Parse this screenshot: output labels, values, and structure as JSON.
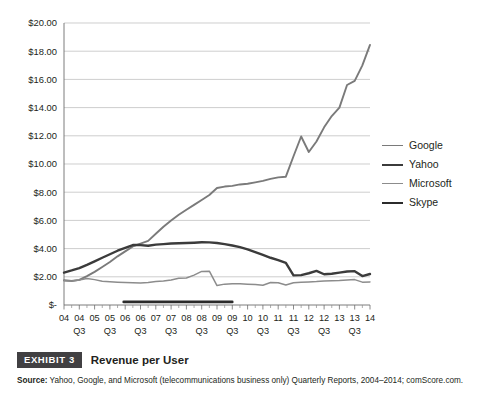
{
  "caption": {
    "badge": "EXHIBIT 3",
    "title": "Revenue per User",
    "source_label": "Source:",
    "source_text": " Yahoo, Google, and Microsoft (telecommunications business only) Quarterly Reports, 2004–2014; comScore.com."
  },
  "legend": {
    "position": "right",
    "items": [
      {
        "label": "Google",
        "color": "#7a7a7a",
        "width": 1.9
      },
      {
        "label": "Yahoo",
        "color": "#3b3b3b",
        "width": 2.4
      },
      {
        "label": "Microsoft",
        "color": "#8c8c8c",
        "width": 1.5
      },
      {
        "label": "Skype",
        "color": "#2b2b2b",
        "width": 2.6
      }
    ]
  },
  "chart_data": {
    "type": "line",
    "title": "Revenue per User",
    "xlabel": "",
    "ylabel": "",
    "ylim": [
      0,
      20
    ],
    "ytick_values": [
      0,
      2,
      4,
      6,
      8,
      10,
      12,
      14,
      16,
      18,
      20
    ],
    "ytick_labels": [
      "$-",
      "$2.00",
      "$4.00",
      "$6.00",
      "$8.00",
      "$10.00",
      "$12.00",
      "$14.00",
      "$16.00",
      "$18.00",
      "$20.00"
    ],
    "grid": true,
    "grid_axis": "y",
    "x_tick_top_labels": [
      "04",
      "04",
      "05",
      "05",
      "06",
      "06",
      "07",
      "07",
      "08",
      "08",
      "09",
      "09",
      "10",
      "10",
      "11",
      "11",
      "12",
      "12",
      "13",
      "13",
      "14"
    ],
    "x_tick_bottom_labels": [
      "",
      "Q3",
      "",
      "Q3",
      "",
      "Q3",
      "",
      "Q3",
      "",
      "Q3",
      "",
      "Q3",
      "",
      "Q3",
      "",
      "Q3",
      "",
      "Q3",
      "",
      "Q3",
      ""
    ],
    "x_minor_ticks_per_label": 2,
    "categories": [
      "04 Q1",
      "04 Q3",
      "05 Q1",
      "05 Q3",
      "06 Q1",
      "06 Q3",
      "07 Q1",
      "07 Q3",
      "08 Q1",
      "08 Q3",
      "09 Q1",
      "09 Q3",
      "10 Q1",
      "10 Q3",
      "11 Q1",
      "11 Q3",
      "12 Q1",
      "12 Q3",
      "13 Q1",
      "13 Q3",
      "14 Q1"
    ],
    "series": [
      {
        "name": "Google",
        "color": "#7a7a7a",
        "width": 1.9,
        "x": [
          0,
          0.5,
          1,
          1.5,
          2,
          2.5,
          3,
          3.5,
          4,
          4.5,
          5,
          5.5,
          6,
          6.5,
          7,
          7.5,
          8,
          8.5,
          9,
          9.5,
          10,
          10.5,
          11,
          11.5,
          12,
          12.5,
          13,
          13.5,
          14,
          14.5,
          15,
          15.5,
          16,
          16.5,
          17,
          17.5,
          18,
          18.5,
          19,
          19.5,
          20
        ],
        "values": [
          1.75,
          1.7,
          1.78,
          2.05,
          2.35,
          2.7,
          3.05,
          3.45,
          3.8,
          4.15,
          4.35,
          4.55,
          5.05,
          5.55,
          6.0,
          6.4,
          6.75,
          7.1,
          7.45,
          7.8,
          8.3,
          8.4,
          8.45,
          8.55,
          8.6,
          8.7,
          8.8,
          8.95,
          9.05,
          9.1,
          10.55,
          11.95,
          10.85,
          11.6,
          12.6,
          13.4,
          14.0,
          15.6,
          15.9,
          17.0,
          18.45
        ]
      },
      {
        "name": "Yahoo",
        "color": "#3b3b3b",
        "width": 2.4,
        "x": [
          0,
          0.5,
          1,
          1.5,
          2,
          2.5,
          3,
          3.5,
          4,
          4.5,
          5,
          5.5,
          6,
          6.5,
          7,
          7.5,
          8,
          8.5,
          9,
          9.5,
          10,
          10.5,
          11,
          11.5,
          12,
          12.5,
          13,
          13.5,
          14,
          14.5,
          15,
          15.5,
          16,
          16.5,
          17,
          17.5,
          18,
          18.5,
          19,
          19.5,
          20
        ],
        "values": [
          2.3,
          2.45,
          2.62,
          2.85,
          3.1,
          3.35,
          3.6,
          3.85,
          4.05,
          4.25,
          4.25,
          4.2,
          4.28,
          4.32,
          4.36,
          4.38,
          4.4,
          4.42,
          4.45,
          4.44,
          4.4,
          4.32,
          4.22,
          4.1,
          3.95,
          3.75,
          3.55,
          3.35,
          3.18,
          2.98,
          2.1,
          2.12,
          2.25,
          2.42,
          2.18,
          2.22,
          2.3,
          2.38,
          2.4,
          2.05,
          2.2
        ]
      },
      {
        "name": "Microsoft",
        "color": "#8c8c8c",
        "width": 1.5,
        "x": [
          0,
          0.5,
          1,
          1.5,
          2,
          2.5,
          3,
          3.5,
          4,
          4.5,
          5,
          5.5,
          6,
          6.5,
          7,
          7.5,
          8,
          8.5,
          9,
          9.5,
          10,
          10.5,
          11,
          11.5,
          12,
          12.5,
          13,
          13.5,
          14,
          14.5,
          15,
          15.5,
          16,
          16.5,
          17,
          17.5,
          18,
          18.5,
          19,
          19.5,
          20
        ],
        "values": [
          1.72,
          1.7,
          1.78,
          1.88,
          1.8,
          1.68,
          1.65,
          1.62,
          1.6,
          1.58,
          1.56,
          1.6,
          1.66,
          1.7,
          1.78,
          1.9,
          1.92,
          2.12,
          2.38,
          2.4,
          1.38,
          1.48,
          1.5,
          1.5,
          1.48,
          1.46,
          1.4,
          1.6,
          1.58,
          1.42,
          1.58,
          1.62,
          1.64,
          1.66,
          1.7,
          1.72,
          1.74,
          1.78,
          1.8,
          1.62,
          1.64
        ]
      },
      {
        "name": "Skype",
        "color": "#2b2b2b",
        "width": 2.6,
        "x": [
          3.9,
          4.5,
          5,
          5.5,
          6,
          6.5,
          7,
          7.5,
          8,
          8.5,
          9,
          9.5,
          10,
          10.5,
          11
        ],
        "values": [
          0.22,
          0.22,
          0.22,
          0.22,
          0.22,
          0.22,
          0.22,
          0.22,
          0.22,
          0.22,
          0.22,
          0.22,
          0.22,
          0.22,
          0.22
        ]
      }
    ]
  }
}
